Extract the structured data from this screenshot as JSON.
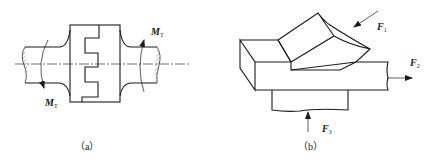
{
  "figure_a": {
    "caption": "（a）",
    "torque_label_top": "M",
    "torque_sub_top": "T",
    "torque_label_bottom": "M",
    "torque_sub_bottom": "T"
  },
  "figure_b": {
    "caption": "（b）",
    "force_1": "F",
    "force_1_sub": "1",
    "force_2": "F",
    "force_2_sub": "2",
    "force_3": "F",
    "force_3_sub": "3"
  }
}
